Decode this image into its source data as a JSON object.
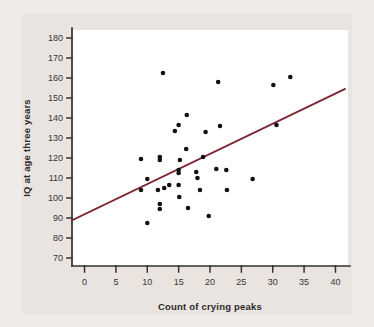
{
  "figure": {
    "background_color": "#efebe8",
    "panel_color": "#e9e4e0",
    "plot_area_color": "#ffffff",
    "axis_color": "#35302f",
    "point_color": "#111111",
    "regression_line_color": "#7d2530"
  },
  "chart_data": {
    "type": "scatter",
    "title": "",
    "xlabel": "Count of crying peaks",
    "ylabel": "IQ at age three years",
    "xlim": [
      -2,
      42
    ],
    "ylim": [
      66,
      184
    ],
    "xticks": [
      0,
      5,
      10,
      15,
      20,
      25,
      30,
      35,
      40
    ],
    "yticks": [
      70,
      80,
      90,
      100,
      110,
      120,
      130,
      140,
      150,
      160,
      170,
      180
    ],
    "xtick_labels": [
      "0",
      "5",
      "10",
      "15",
      "20",
      "25",
      "30",
      "35",
      "40"
    ],
    "ytick_labels": [
      "70",
      "80",
      "90",
      "100",
      "110",
      "120",
      "130",
      "140",
      "150",
      "160",
      "170",
      "180"
    ],
    "grid": false,
    "legend": false,
    "points": [
      {
        "x": 9.0,
        "y": 119.5
      },
      {
        "x": 9.0,
        "y": 104.0
      },
      {
        "x": 10.0,
        "y": 109.5
      },
      {
        "x": 10.0,
        "y": 87.5
      },
      {
        "x": 11.7,
        "y": 104.0
      },
      {
        "x": 12.0,
        "y": 120.5
      },
      {
        "x": 12.0,
        "y": 119.0
      },
      {
        "x": 12.0,
        "y": 97.0
      },
      {
        "x": 12.0,
        "y": 94.5
      },
      {
        "x": 12.5,
        "y": 162.5
      },
      {
        "x": 12.7,
        "y": 105.0
      },
      {
        "x": 13.5,
        "y": 106.5
      },
      {
        "x": 14.4,
        "y": 133.5
      },
      {
        "x": 15.0,
        "y": 136.5
      },
      {
        "x": 15.2,
        "y": 119.0
      },
      {
        "x": 15.0,
        "y": 114.0
      },
      {
        "x": 15.0,
        "y": 112.5
      },
      {
        "x": 15.0,
        "y": 106.5
      },
      {
        "x": 15.1,
        "y": 100.5
      },
      {
        "x": 16.3,
        "y": 141.5
      },
      {
        "x": 16.2,
        "y": 124.5
      },
      {
        "x": 16.5,
        "y": 95.0
      },
      {
        "x": 17.8,
        "y": 113.0
      },
      {
        "x": 18.0,
        "y": 110.0
      },
      {
        "x": 18.4,
        "y": 104.0
      },
      {
        "x": 18.9,
        "y": 120.5
      },
      {
        "x": 19.3,
        "y": 133.0
      },
      {
        "x": 19.8,
        "y": 91.0
      },
      {
        "x": 21.0,
        "y": 114.5
      },
      {
        "x": 21.3,
        "y": 158.0
      },
      {
        "x": 21.6,
        "y": 136.0
      },
      {
        "x": 22.6,
        "y": 114.0
      },
      {
        "x": 22.7,
        "y": 104.0
      },
      {
        "x": 26.8,
        "y": 109.5
      },
      {
        "x": 30.1,
        "y": 156.5
      },
      {
        "x": 30.6,
        "y": 136.5
      },
      {
        "x": 32.8,
        "y": 160.5
      }
    ],
    "regression_line": {
      "x_start": -2.0,
      "y_start": 88.8,
      "x_end": 41.5,
      "y_end": 154.5
    }
  }
}
